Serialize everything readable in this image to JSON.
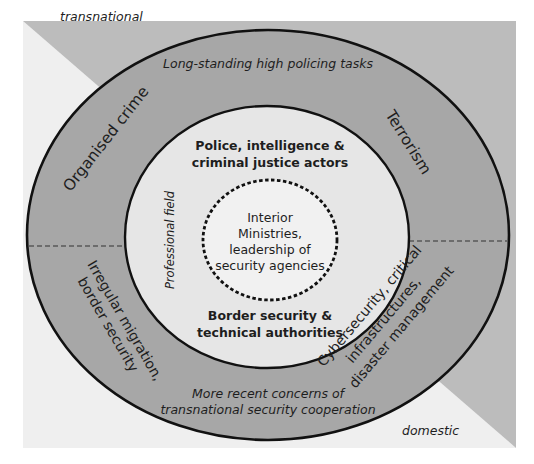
{
  "diagram": {
    "type": "concentric-circles",
    "colors": {
      "transnational_background": "#bcbcbc",
      "domestic_background": "#efefef",
      "outer_ring": "#a7a7a7",
      "professional_field": "#e6e6e6",
      "core": "#f1f1f1",
      "stroke": "#111111"
    },
    "corners": {
      "top_left": "transnational",
      "bottom_right": "domestic"
    },
    "outer_ring": {
      "top_band": "Long-standing high policing tasks",
      "bottom_band": {
        "line1": "More recent concerns of",
        "line2": "transnational security cooperation"
      },
      "quadrants": {
        "upper_left": "Organised crime",
        "upper_right": "Terrorism",
        "lower_left": {
          "line1": "Irregular migration,",
          "line2": "border security"
        },
        "lower_right": {
          "line1": "Cybersecurity, critical",
          "line2": "infrastructures,",
          "line3": "disaster management"
        }
      }
    },
    "middle_ring": {
      "side_label": "Professional field",
      "top_actors": {
        "line1": "Police, intelligence &",
        "line2": "criminal justice actors"
      },
      "bottom_actors": {
        "line1": "Border security &",
        "line2": "technical authorities"
      }
    },
    "core": {
      "line1": "Interior",
      "line2": "Ministries,",
      "line3": "leadership of",
      "line4": "security agencies"
    }
  }
}
